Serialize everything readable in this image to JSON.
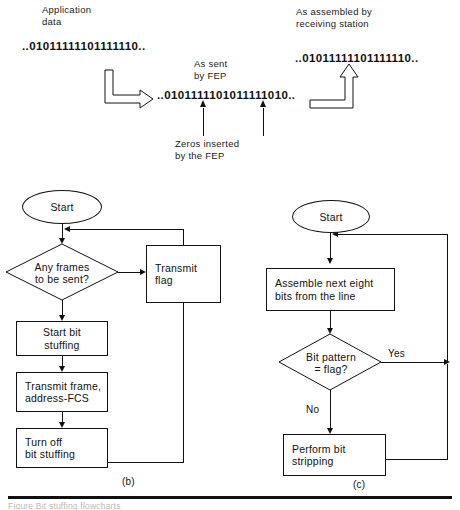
{
  "figure": {
    "title_fragment": "Figure          Bit stuffing flowcharts",
    "panel_a": {
      "labels": {
        "application_data": "Application\ndata",
        "as_sent_by_fep": "As sent\nby FEP",
        "as_assembled": "As assembled by\nreceiving station",
        "zeros_inserted": "Zeros inserted\nby the FEP"
      },
      "bit_strings": {
        "application": "..01011111101111110..",
        "as_sent": "..0101111101011111010..",
        "as_assembled": "..01011111101111110.."
      },
      "arrows": {
        "down_right_arrow": "elbow-arrow-right",
        "up_right_arrow": "elbow-arrow-up",
        "marker_one": "zero-insert-marker-1",
        "marker_two": "zero-insert-marker-2"
      }
    },
    "panel_b": {
      "letter": "(b)",
      "nodes": {
        "start": "Start",
        "decision": "Any frames\nto be sent?",
        "start_bit_stuffing": "Start bit\nstuffing",
        "transmit_frame": "Transmit frame,\naddress-FCS",
        "turn_off": "Turn off\nbit stuffing",
        "transmit_flag": "Transmit\nflag"
      }
    },
    "panel_c": {
      "letter": "(c)",
      "nodes": {
        "start": "Start",
        "assemble": "Assemble next eight\nbits from the line",
        "decision": "Bit pattern\n= flag?",
        "perform_strip": "Perform bit\nstripping"
      },
      "edges": {
        "yes": "Yes",
        "no": "No"
      }
    }
  }
}
